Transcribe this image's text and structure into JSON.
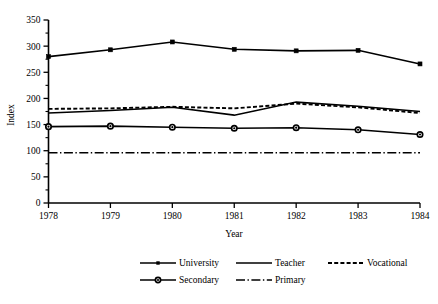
{
  "chart_data": {
    "type": "line",
    "title": "",
    "xlabel": "Year",
    "ylabel": "Index",
    "x": [
      1978,
      1979,
      1980,
      1981,
      1982,
      1983,
      1984
    ],
    "categories": [
      "1978",
      "1979",
      "1980",
      "1981",
      "1982",
      "1983",
      "1984"
    ],
    "xlim": [
      1978,
      1984
    ],
    "ylim": [
      0,
      350
    ],
    "y_ticks": [
      0,
      50,
      100,
      150,
      200,
      250,
      300,
      350
    ],
    "y_tick_labels": [
      "0",
      "50",
      "100",
      "150",
      "200",
      "250",
      "300",
      "350"
    ],
    "y_minor_tick_interval": 25,
    "grid": false,
    "legend_position": "bottom",
    "series": [
      {
        "name": "University",
        "style": "solid-with-square-markers",
        "marker": "square",
        "color": "#000000",
        "values": [
          280,
          293,
          308,
          294,
          291,
          292,
          266
        ]
      },
      {
        "name": "Teacher",
        "style": "solid",
        "marker": "none",
        "color": "#000000",
        "values": [
          172,
          177,
          183,
          168,
          193,
          185,
          175
        ]
      },
      {
        "name": "Vocational",
        "style": "dashed",
        "marker": "none",
        "color": "#000000",
        "values": [
          180,
          181,
          184,
          181,
          190,
          183,
          172
        ]
      },
      {
        "name": "Secondary",
        "style": "solid-with-circle-markers",
        "marker": "circle",
        "color": "#000000",
        "values": [
          146,
          147,
          145,
          143,
          144,
          140,
          131
        ]
      },
      {
        "name": "Primary",
        "style": "dash-dot",
        "marker": "none",
        "color": "#000000",
        "values": [
          96,
          96,
          96,
          96,
          96,
          96,
          96
        ]
      }
    ]
  },
  "legend": {
    "entries": [
      {
        "label": "University"
      },
      {
        "label": "Teacher"
      },
      {
        "label": "Vocational"
      },
      {
        "label": "Secondary"
      },
      {
        "label": "Primary"
      }
    ]
  }
}
